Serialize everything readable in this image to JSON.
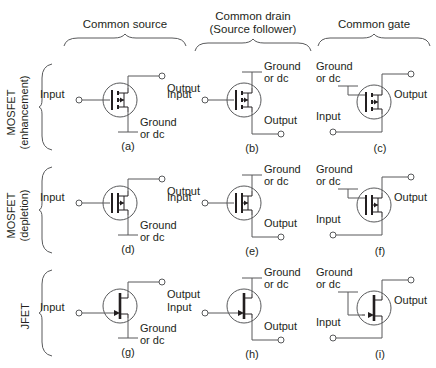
{
  "figure": {
    "columns": [
      {
        "id": "common-source",
        "label": "Common source",
        "sublabel": ""
      },
      {
        "id": "common-drain",
        "label": "Common drain",
        "sublabel": "(Source follower)"
      },
      {
        "id": "common-gate",
        "label": "Common gate",
        "sublabel": ""
      }
    ],
    "rows": [
      {
        "id": "mosfet-enhancement",
        "line1": "MOSFET",
        "line2": "(enhancement)"
      },
      {
        "id": "mosfet-depletion",
        "line1": "MOSFET",
        "line2": "(depletion)"
      },
      {
        "id": "jfet",
        "line1": "JFET",
        "line2": ""
      }
    ],
    "terminal_labels": {
      "input": "Input",
      "output": "Output",
      "ground_line1": "Ground",
      "ground_line2": "or dc"
    },
    "panels": [
      {
        "id": "a",
        "caption": "(a)",
        "row": "mosfet-enhancement",
        "column": "common-source",
        "device": "mosfet-enhancement",
        "gate": "Input",
        "drain": "Output",
        "source": "Ground or dc"
      },
      {
        "id": "b",
        "caption": "(b)",
        "row": "mosfet-enhancement",
        "column": "common-drain",
        "device": "mosfet-enhancement",
        "gate": "Input",
        "drain": "Ground or dc",
        "source": "Output"
      },
      {
        "id": "c",
        "caption": "(c)",
        "row": "mosfet-enhancement",
        "column": "common-gate",
        "device": "mosfet-enhancement",
        "gate": "Ground or dc",
        "drain": "Output",
        "source": "Input"
      },
      {
        "id": "d",
        "caption": "(d)",
        "row": "mosfet-depletion",
        "column": "common-source",
        "device": "mosfet-depletion",
        "gate": "Input",
        "drain": "Output",
        "source": "Ground or dc"
      },
      {
        "id": "e",
        "caption": "(e)",
        "row": "mosfet-depletion",
        "column": "common-drain",
        "device": "mosfet-depletion",
        "gate": "Input",
        "drain": "Ground or dc",
        "source": "Output"
      },
      {
        "id": "f",
        "caption": "(f)",
        "row": "mosfet-depletion",
        "column": "common-gate",
        "device": "mosfet-depletion",
        "gate": "Ground or dc",
        "drain": "Output",
        "source": "Input"
      },
      {
        "id": "g",
        "caption": "(g)",
        "row": "jfet",
        "column": "common-source",
        "device": "jfet",
        "gate": "Input",
        "drain": "Output",
        "source": "Ground or dc"
      },
      {
        "id": "h",
        "caption": "(h)",
        "row": "jfet",
        "column": "common-drain",
        "device": "jfet",
        "gate": "Input",
        "drain": "Ground or dc",
        "source": "Output"
      },
      {
        "id": "i",
        "caption": "(i)",
        "row": "jfet",
        "column": "common-gate",
        "device": "jfet",
        "gate": "Ground or dc",
        "drain": "Output",
        "source": "Input"
      }
    ],
    "colors": {
      "background": "#ffffff",
      "ink": "#231f20",
      "wire": "#58595b"
    }
  }
}
